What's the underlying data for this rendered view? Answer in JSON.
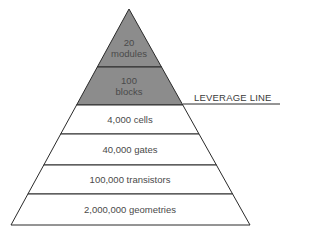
{
  "diagram": {
    "type": "pyramid",
    "colors": {
      "shaded": "#8c8c8c",
      "unshaded": "#ffffff",
      "stroke": "#2a2a2a"
    },
    "levels": [
      {
        "line1": "20",
        "line2": "modules",
        "shaded": true
      },
      {
        "line1": "100",
        "line2": "blocks",
        "shaded": true
      },
      {
        "label": "4,000 cells",
        "shaded": false
      },
      {
        "label": "40,000 gates",
        "shaded": false
      },
      {
        "label": "100,000 transistors",
        "shaded": false
      },
      {
        "label": "2,000,000 geometries",
        "shaded": false
      }
    ],
    "leverage_line": {
      "label": "LEVERAGE LINE"
    }
  }
}
